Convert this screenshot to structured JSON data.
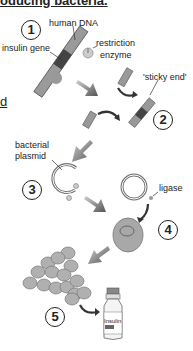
{
  "title": "oducing bacteria.",
  "clipped_left_text": "d",
  "steps": [
    {
      "number": "1"
    },
    {
      "number": "2"
    },
    {
      "number": "3"
    },
    {
      "number": "4"
    },
    {
      "number": "5"
    }
  ],
  "labels": {
    "human_dna": "human DNA",
    "insulin_gene": "insulin gene",
    "restriction": "restriction",
    "enzyme": "enzyme",
    "sticky_end": "'sticky end'",
    "bacterial": "bacterial",
    "plasmid": "plasmid",
    "ligase": "ligase",
    "vial": "Insulin"
  },
  "colors": {
    "dna_light": "#9a9a9a",
    "dna_dark": "#444444",
    "arrow": "#6a6a6a",
    "cell": "#b0b0b0"
  }
}
